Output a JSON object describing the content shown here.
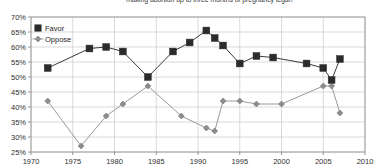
{
  "chart_data": {
    "type": "line",
    "title": "making abortion up to three months of pregnancy legal?",
    "xlabel": "",
    "ylabel": "",
    "xlim": [
      1970,
      2010
    ],
    "ylim": [
      25,
      70
    ],
    "grid": true,
    "legend_position": "top-left",
    "ytick_labels": [
      "70%",
      "65%",
      "60%",
      "55%",
      "50%",
      "45%",
      "40%",
      "35%",
      "30%",
      "25%"
    ],
    "ytick_values": [
      70,
      65,
      60,
      55,
      50,
      45,
      40,
      35,
      30,
      25
    ],
    "xtick_labels": [
      "1970",
      "1975",
      "1980",
      "1985",
      "1990",
      "1995",
      "2000",
      "2005",
      "2010"
    ],
    "xtick_values": [
      1970,
      1975,
      1980,
      1985,
      1990,
      1995,
      2000,
      2005,
      2010
    ],
    "series": [
      {
        "name": "Favor",
        "marker": "filled-square",
        "color": "#2b2b2b",
        "x": [
          1972,
          1977,
          1979,
          1981,
          1984,
          1987,
          1989,
          1991,
          1992,
          1993,
          1995,
          1997,
          1999,
          2003,
          2005,
          2006,
          2007
        ],
        "values": [
          53.0,
          59.5,
          60.0,
          58.5,
          50.0,
          58.5,
          61.5,
          65.5,
          63.0,
          60.5,
          54.5,
          57.0,
          56.5,
          54.5,
          53.0,
          49.0,
          56.0
        ]
      },
      {
        "name": "Oppose",
        "marker": "diamond",
        "color": "#8c8c8c",
        "x": [
          1972,
          1976,
          1979,
          1981,
          1984,
          1988,
          1991,
          1992,
          1993,
          1995,
          1997,
          2000,
          2005,
          2006,
          2007
        ],
        "values": [
          42.0,
          27.0,
          37.0,
          41.0,
          47.0,
          37.0,
          33.0,
          32.0,
          42.0,
          42.0,
          41.0,
          41.0,
          47.0,
          47.0,
          38.0
        ]
      }
    ]
  },
  "legend": {
    "items": [
      {
        "label": "Favor",
        "marker": "filled-square"
      },
      {
        "label": "Oppose",
        "marker": "diamond"
      }
    ]
  }
}
